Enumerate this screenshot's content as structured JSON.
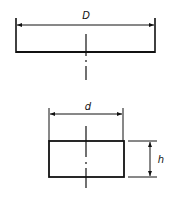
{
  "colors": {
    "line": "#111111",
    "background": "#ffffff"
  },
  "top_view": {
    "dimension_label": "D",
    "description": "wide shallow rectangle with overall diameter dimension"
  },
  "bottom_view": {
    "width_label": "d",
    "height_label": "h",
    "description": "rectangle with width and height dimensions"
  }
}
